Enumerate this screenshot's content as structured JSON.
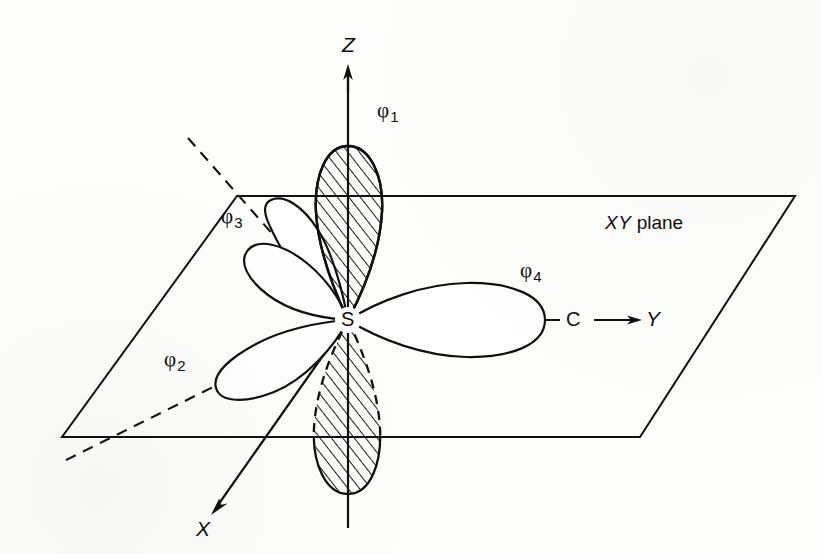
{
  "figure": {
    "background_color": "#fdfdfb",
    "ink_color": "#111111",
    "line_width": 2
  },
  "axes": {
    "z": {
      "label": "Z",
      "direction": "up",
      "arrow": true
    },
    "y": {
      "label": "Y",
      "direction": "right",
      "arrow": true
    },
    "x": {
      "label": "X",
      "direction": "down-left",
      "arrow": true
    }
  },
  "plane": {
    "label_italic": "XY",
    "label_roman": " plane",
    "corners": "parallelogram"
  },
  "atoms": [
    {
      "name": "sulfur-atom",
      "label": "S",
      "x": 348,
      "y": 320
    },
    {
      "name": "carbon-atom",
      "label": "C",
      "x": 573,
      "y": 320
    }
  ],
  "orbitals": [
    {
      "id": "phi1",
      "symbol": "φ",
      "subscript": "1",
      "direction": "up-z",
      "hatched": true,
      "label_x": 385,
      "label_y": 108
    },
    {
      "id": "phi2",
      "symbol": "φ",
      "subscript": "2",
      "direction": "lower-left",
      "hatched": false,
      "label_x": 171,
      "label_y": 356
    },
    {
      "id": "phi3",
      "symbol": "φ",
      "subscript": "3",
      "direction": "upper-left",
      "hatched": false,
      "label_x": 228,
      "label_y": 213
    },
    {
      "id": "phi4",
      "symbol": "φ",
      "subscript": "4",
      "direction": "right-y",
      "hatched": false,
      "label_x": 527,
      "label_y": 268
    },
    {
      "id": "phi1-lower",
      "symbol": "φ",
      "subscript": "1",
      "direction": "down-z",
      "hatched": true,
      "label_x": null,
      "label_y": null
    }
  ]
}
